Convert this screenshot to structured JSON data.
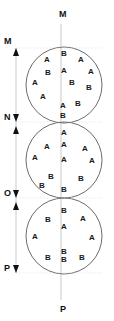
{
  "figure": {
    "title_top_label": "M",
    "title_bottom_label": "P",
    "axis_color": "#b9b9b9",
    "circle_stroke_color": "#5a5a5a",
    "text_color": "#1a1a1a",
    "width": 114,
    "height": 321
  },
  "axis": {
    "label_top": "M",
    "label_bottom": "P",
    "x": 61,
    "top_y": 24,
    "bottom_y": 300,
    "markers": [
      {
        "label": "M",
        "y": 48
      },
      {
        "label": "N",
        "y": 122
      },
      {
        "label": "O",
        "y": 198
      },
      {
        "label": "P",
        "y": 273
      }
    ],
    "segments": [
      {
        "name": "M-N",
        "from": "M",
        "to": "N",
        "y_start": 48,
        "y_end": 122
      },
      {
        "name": "N-O",
        "from": "N",
        "to": "O",
        "y_start": 122,
        "y_end": 198
      },
      {
        "name": "O-P",
        "from": "O",
        "to": "P",
        "y_start": 198,
        "y_end": 273
      }
    ]
  },
  "circles": [
    {
      "name": "top-circle",
      "cx": 64,
      "cy": 85,
      "r": 38,
      "particles": [
        {
          "label": "B",
          "x": 64,
          "y": 54
        },
        {
          "label": "A",
          "x": 47,
          "y": 60
        },
        {
          "label": "A",
          "x": 81,
          "y": 60
        },
        {
          "label": "A",
          "x": 64,
          "y": 71
        },
        {
          "label": "B",
          "x": 48,
          "y": 73
        },
        {
          "label": "A",
          "x": 91,
          "y": 72
        },
        {
          "label": "A",
          "x": 35,
          "y": 83
        },
        {
          "label": "B",
          "x": 72,
          "y": 83
        },
        {
          "label": "B",
          "x": 89,
          "y": 88
        },
        {
          "label": "A",
          "x": 43,
          "y": 97
        },
        {
          "label": "B",
          "x": 78,
          "y": 104
        },
        {
          "label": "A",
          "x": 63,
          "y": 106
        },
        {
          "label": "B",
          "x": 63,
          "y": 116
        }
      ]
    },
    {
      "name": "middle-circle",
      "cx": 64,
      "cy": 160,
      "r": 38,
      "particles": [
        {
          "label": "A",
          "x": 64,
          "y": 133
        },
        {
          "label": "A",
          "x": 64,
          "y": 145
        },
        {
          "label": "A",
          "x": 47,
          "y": 147
        },
        {
          "label": "A",
          "x": 85,
          "y": 149
        },
        {
          "label": "A",
          "x": 35,
          "y": 158
        },
        {
          "label": "A",
          "x": 64,
          "y": 160
        },
        {
          "label": "A",
          "x": 92,
          "y": 161
        },
        {
          "label": "B",
          "x": 51,
          "y": 177
        },
        {
          "label": "B",
          "x": 81,
          "y": 179
        },
        {
          "label": "B",
          "x": 42,
          "y": 186
        },
        {
          "label": "B",
          "x": 64,
          "y": 190
        }
      ]
    },
    {
      "name": "bottom-circle",
      "cx": 64,
      "cy": 236,
      "r": 38,
      "particles": [
        {
          "label": "B",
          "x": 64,
          "y": 211
        },
        {
          "label": "B",
          "x": 48,
          "y": 220
        },
        {
          "label": "A",
          "x": 83,
          "y": 219
        },
        {
          "label": "A",
          "x": 64,
          "y": 227
        },
        {
          "label": "A",
          "x": 35,
          "y": 237
        },
        {
          "label": "A",
          "x": 92,
          "y": 238
        },
        {
          "label": "B",
          "x": 64,
          "y": 252
        },
        {
          "label": "B",
          "x": 48,
          "y": 258
        },
        {
          "label": "B",
          "x": 64,
          "y": 260
        },
        {
          "label": "B",
          "x": 82,
          "y": 258
        }
      ]
    }
  ]
}
